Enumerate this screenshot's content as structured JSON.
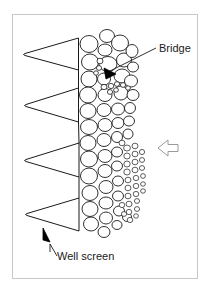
{
  "figure": {
    "background_color": "#ffffff",
    "border_color": "#c8c8c8",
    "line_color": "#1a1a1a",
    "grain_stroke_color": "#1a1a1a",
    "grain_fill_color": "#ffffff",
    "marker_fill_color": "#000000"
  },
  "labels": {
    "bridge": "Bridge",
    "well_screen": "Well screen"
  },
  "annotations": {
    "bridge_leader": "leader-line-to-bridge-marker",
    "well_screen_leader": "leader-line-to-screen-wedge"
  },
  "icons": {
    "flow_arrow": "flow-arrow-left",
    "bridge_marker": "bridge-wedge-marker",
    "well_screen_arrowhead": "arrowhead-up"
  },
  "components": {
    "screen_wedges": 4,
    "screen_description": "wedge-wire screen profile, apex pointing left",
    "pack_description": "graded gravel and sand pack, coarse near screen grading finer outward"
  }
}
